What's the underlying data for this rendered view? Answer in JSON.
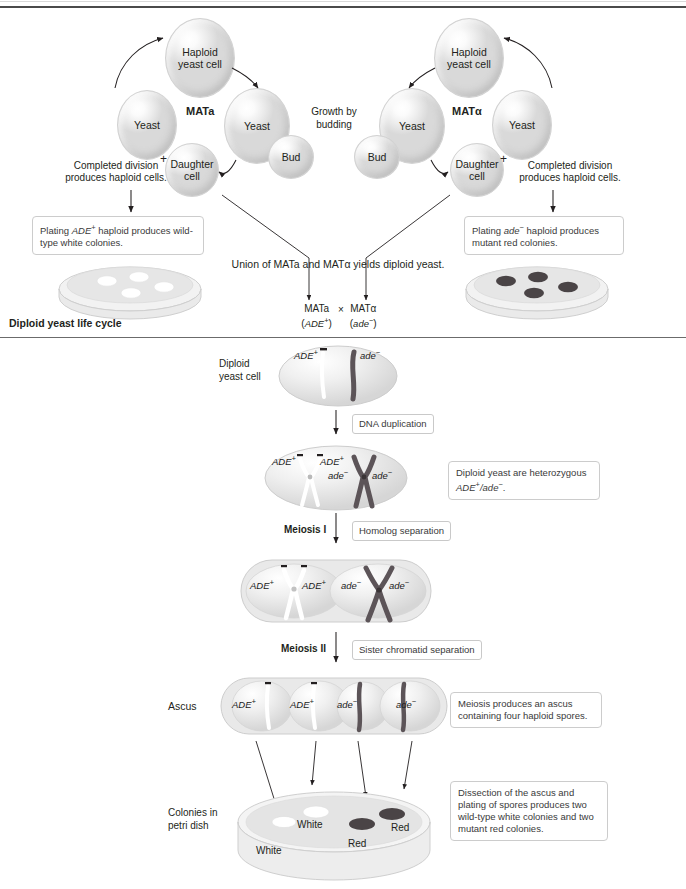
{
  "figure": {
    "section_label": "Diploid yeast life cycle"
  },
  "haploid_cycle": {
    "left": {
      "mating_type": "MATa",
      "haploid_cell_label": "Haploid\nyeast cell",
      "yeast_label": "Yeast",
      "bud_label": "Bud",
      "daughter_label": "Daughter\ncell",
      "parent_yeast_label": "Yeast",
      "plus_sign": "+",
      "completed_division": "Completed division\nproduces haploid cells.",
      "callout": "Plating ADE+ haploid produces wild-type white colonies.",
      "callout_pre": "Plating ",
      "callout_gene": "ADE",
      "callout_sup": "+",
      "callout_post": " haploid produces wild-type white colonies.",
      "colony_color": "#ffffff",
      "colony_count": 4
    },
    "right": {
      "mating_type": "MATα",
      "haploid_cell_label": "Haploid\nyeast cell",
      "yeast_label": "Yeast",
      "bud_label": "Bud",
      "daughter_label": "Daughter\ncell",
      "parent_yeast_label": "Yeast",
      "plus_sign": "+",
      "completed_division": "Completed division\nproduces haploid cells.",
      "callout_pre": "Plating ",
      "callout_gene": "ade",
      "callout_sup": "−",
      "callout_post": " haploid produces mutant red colonies.",
      "colony_color": "#4a4446",
      "colony_count": 4
    },
    "growth_label": "Growth by\nbudding",
    "union_text": "Union of MATa and MATα yields diploid yeast.",
    "cross": {
      "left_type": "MATa",
      "left_genotype_gene": "ADE",
      "left_genotype_sup": "+",
      "times": "×",
      "right_type": "MATα",
      "right_genotype_gene": "ade",
      "right_genotype_sup": "−"
    }
  },
  "diploid_cycle": {
    "diploid_cell_label": "Diploid\nyeast cell",
    "diploid_cell": {
      "allele_left_gene": "ADE",
      "allele_left_sup": "+",
      "allele_right_gene": "ade",
      "allele_right_sup": "−"
    },
    "steps": [
      {
        "name": "dna-duplication",
        "arrow_label": "",
        "tag": "DNA duplication"
      },
      {
        "name": "meiosis-i",
        "arrow_label": "Meiosis I",
        "tag": "Homolog separation"
      },
      {
        "name": "meiosis-ii",
        "arrow_label": "Meiosis II",
        "tag": "Sister chromatid separation"
      }
    ],
    "duplicated_cell": {
      "labels": [
        "ADE+",
        "ADE+",
        "ade−",
        "ade−"
      ],
      "l1_gene": "ADE",
      "l1_sup": "+",
      "l2_gene": "ADE",
      "l2_sup": "+",
      "l3_gene": "ade",
      "l3_sup": "−",
      "l4_gene": "ade",
      "l4_sup": "−"
    },
    "heterozygous_callout_line1": "Diploid yeast are heterozygous",
    "heterozygous_callout_gene1": "ADE",
    "heterozygous_callout_sup1": "+",
    "heterozygous_callout_sep": "/",
    "heterozygous_callout_gene2": "ade",
    "heterozygous_callout_sup2": "−",
    "heterozygous_callout_end": ".",
    "meiosis_i_cell": {
      "l1_gene": "ADE",
      "l1_sup": "+",
      "l2_gene": "ADE",
      "l2_sup": "+",
      "l3_gene": "ade",
      "l3_sup": "−",
      "l4_gene": "ade",
      "l4_sup": "−"
    },
    "ascus_label": "Ascus",
    "ascus_spores": [
      {
        "gene": "ADE",
        "sup": "+",
        "color": "#ffffff"
      },
      {
        "gene": "ADE",
        "sup": "+",
        "color": "#ffffff"
      },
      {
        "gene": "ade",
        "sup": "−",
        "color": "#4a4446"
      },
      {
        "gene": "ade",
        "sup": "−",
        "color": "#4a4446"
      }
    ],
    "ascus_callout": "Meiosis produces an ascus containing four haploid spores.",
    "colonies_label": "Colonies in\npetri dish",
    "colonies": [
      {
        "label": "White",
        "color": "#ffffff"
      },
      {
        "label": "White",
        "color": "#ffffff"
      },
      {
        "label": "Red",
        "color": "#4a4446"
      },
      {
        "label": "Red",
        "color": "#4a4446"
      }
    ],
    "dissection_callout": "Dissection of the ascus and plating of spores produces two wild-type white colonies and two mutant red colonies."
  },
  "colors": {
    "ink": "#231f20",
    "rule": "#4a4a4a",
    "white_colony": "#ffffff",
    "red_colony": "#4a4446",
    "cell_fill": "#ececec",
    "callout_border": "#cccccc"
  }
}
